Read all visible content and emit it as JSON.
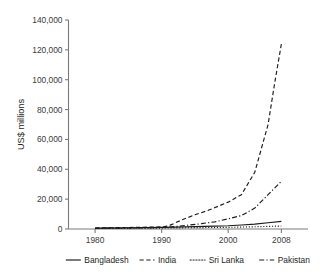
{
  "chart_data": {
    "type": "line",
    "title": "",
    "subtitle": "",
    "xlabel": "",
    "ylabel": "US$ millions",
    "xlim": [
      1976,
      2012
    ],
    "ylim": [
      0,
      140000
    ],
    "grid": false,
    "legend_position": "bottom",
    "x_ticks": [
      "1980",
      "1990",
      "2000",
      "2008"
    ],
    "x_tick_values": [
      1980,
      1990,
      2000,
      2008
    ],
    "y_ticks": [
      "0",
      "20,000",
      "40,000",
      "60,000",
      "80,000",
      "100,000",
      "120,000",
      "140,000"
    ],
    "y_tick_values": [
      0,
      20000,
      40000,
      60000,
      80000,
      100000,
      120000,
      140000
    ],
    "series": [
      {
        "name": "Bangladesh",
        "style": "solid",
        "x": [
          1980,
          1985,
          1990,
          1992,
          1995,
          1998,
          2000,
          2002,
          2004,
          2006,
          2008
        ],
        "values": [
          600,
          800,
          1100,
          1300,
          1600,
          1900,
          2200,
          2700,
          3300,
          4200,
          5100
        ]
      },
      {
        "name": "India",
        "style": "dashed",
        "x": [
          1980,
          1985,
          1990,
          1991,
          1993,
          1995,
          1997,
          2000,
          2002,
          2004,
          2006,
          2007,
          2008
        ],
        "values": [
          700,
          1000,
          1400,
          2000,
          6000,
          9500,
          12500,
          18000,
          23000,
          38000,
          70000,
          98000,
          124000
        ]
      },
      {
        "name": "Sri Lanka",
        "style": "dotted",
        "x": [
          1980,
          1985,
          1990,
          1993,
          1996,
          2000,
          2004,
          2008
        ],
        "values": [
          300,
          450,
          600,
          800,
          950,
          1100,
          1500,
          2000
        ]
      },
      {
        "name": "Pakistan",
        "style": "dashdot",
        "x": [
          1980,
          1985,
          1990,
          1992,
          1994,
          1996,
          1998,
          2000,
          2002,
          2004,
          2006,
          2008
        ],
        "values": [
          500,
          700,
          1000,
          1600,
          2600,
          3600,
          4800,
          6800,
          9000,
          14000,
          23000,
          32000
        ]
      }
    ]
  },
  "axis": {
    "y_title": "US$ millions"
  },
  "legend": {
    "items": [
      {
        "label": "Bangladesh",
        "style": "solid"
      },
      {
        "label": "India",
        "style": "dashed"
      },
      {
        "label": "Sri Lanka",
        "style": "dotted"
      },
      {
        "label": "Pakistan",
        "style": "dashdot"
      }
    ]
  }
}
